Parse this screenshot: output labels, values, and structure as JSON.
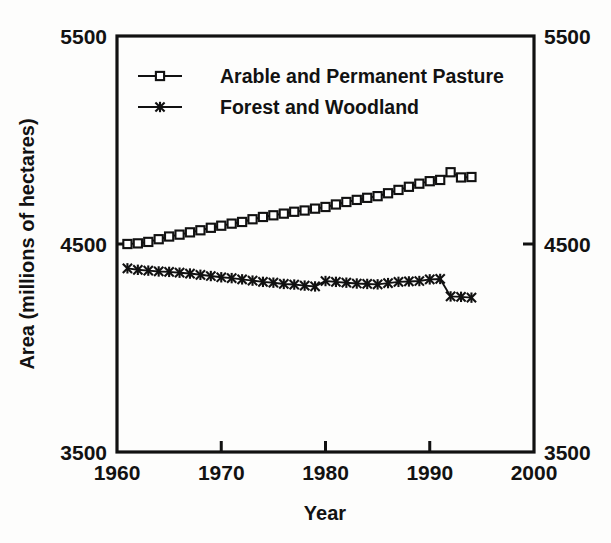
{
  "chart_data": {
    "type": "line",
    "title": "",
    "xlabel": "Year",
    "ylabel": "Area (millions of hectares)",
    "xlim": [
      1960,
      2000
    ],
    "ylim": [
      3500,
      5500
    ],
    "xticks": [
      1960,
      1970,
      1980,
      1990,
      2000
    ],
    "yticks": [
      3500,
      4500,
      5500
    ],
    "xtick_labels": [
      "1960",
      "1970",
      "1980",
      "1990",
      "2000"
    ],
    "ytick_labels": [
      "3500",
      "4500",
      "5500"
    ],
    "ytick_labels_right": [
      "3500",
      "4500",
      "5500"
    ],
    "grid": false,
    "legend_position": "upper-left-inside",
    "axis_color": "#111111",
    "background_color": "#fdfdfc",
    "series": [
      {
        "name": "Arable and Permanent Pasture",
        "marker": "open-square",
        "color": "#111111",
        "x": [
          1961,
          1962,
          1963,
          1964,
          1965,
          1966,
          1967,
          1968,
          1969,
          1970,
          1971,
          1972,
          1973,
          1974,
          1975,
          1976,
          1977,
          1978,
          1979,
          1980,
          1981,
          1982,
          1983,
          1984,
          1985,
          1986,
          1987,
          1988,
          1989,
          1990,
          1991,
          1992,
          1993,
          1994
        ],
        "values": [
          4500,
          4503,
          4510,
          4523,
          4536,
          4545,
          4556,
          4566,
          4578,
          4588,
          4598,
          4606,
          4619,
          4630,
          4638,
          4646,
          4655,
          4661,
          4670,
          4678,
          4690,
          4702,
          4712,
          4722,
          4730,
          4744,
          4760,
          4775,
          4790,
          4802,
          4808,
          4845,
          4820,
          4822
        ]
      },
      {
        "name": "Forest and Woodland",
        "marker": "x",
        "color": "#111111",
        "x": [
          1961,
          1962,
          1963,
          1964,
          1965,
          1966,
          1967,
          1968,
          1969,
          1970,
          1971,
          1972,
          1973,
          1974,
          1975,
          1976,
          1977,
          1978,
          1979,
          1980,
          1981,
          1982,
          1983,
          1984,
          1985,
          1986,
          1987,
          1988,
          1989,
          1990,
          1991,
          1992,
          1993,
          1994
        ],
        "values": [
          4383,
          4376,
          4372,
          4368,
          4366,
          4362,
          4358,
          4352,
          4346,
          4340,
          4336,
          4330,
          4324,
          4318,
          4314,
          4308,
          4305,
          4300,
          4296,
          4322,
          4318,
          4314,
          4310,
          4308,
          4306,
          4312,
          4318,
          4320,
          4322,
          4330,
          4332,
          4248,
          4246,
          4242
        ]
      }
    ],
    "legend": [
      {
        "label": "Arable and Permanent Pasture",
        "marker": "open-square"
      },
      {
        "label": "Forest and Woodland",
        "marker": "x"
      }
    ]
  }
}
